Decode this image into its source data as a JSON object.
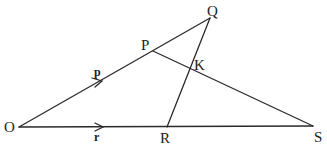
{
  "diagram": {
    "points": {
      "O": {
        "label": "O",
        "x": 19,
        "y": 127
      },
      "P": {
        "label": "P",
        "x": 153,
        "y": 51
      },
      "Q": {
        "label": "Q",
        "x": 210,
        "y": 18
      },
      "K": {
        "label": "K",
        "x": 190,
        "y": 69
      },
      "R": {
        "label": "R",
        "x": 167,
        "y": 127
      },
      "S": {
        "label": "S",
        "x": 313,
        "y": 126
      }
    },
    "segments": [
      {
        "from": "O",
        "to": "Q"
      },
      {
        "from": "O",
        "to": "S"
      },
      {
        "from": "P",
        "to": "S"
      },
      {
        "from": "R",
        "to": "Q"
      }
    ],
    "vectors": {
      "p": {
        "label": "p",
        "along": "OP"
      },
      "r": {
        "label": "r",
        "along": "OR"
      }
    }
  }
}
